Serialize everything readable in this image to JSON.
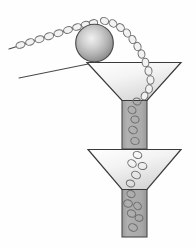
{
  "figure": {
    "title": "Ball and pebbles feeding a two-stage funnel",
    "background_color": "#fefefe",
    "width": 195,
    "height": 247
  },
  "palette": {
    "outline": "#3a3a3a",
    "outline_light": "#5a5a5a",
    "sphere_highlight": "#efefef",
    "sphere_mid": "#b8b8b8",
    "sphere_edge": "#8d8d8d",
    "funnel_light": "#ffffff",
    "funnel_shade": "#dcdcdc",
    "stem_fill": "#a9a9a9",
    "stem_fill_dark": "#9c9c9c",
    "pebble_fill": "#f2f2f2",
    "pebble_outline": "#707070",
    "pebble_in_stem_outline": "#6e6e6e",
    "ramp_line": "#4a4a4a"
  },
  "parts": {
    "ramp_upper_label": "inclined-ramp-upper",
    "ramp_lower_label": "inclined-ramp-lower",
    "sphere_label": "large-sphere",
    "funnel_top_label": "upper-funnel",
    "funnel_bottom_label": "lower-funnel",
    "stem_top_label": "upper-funnel-stem",
    "stem_bottom_label": "lower-funnel-stem",
    "stream_label": "pebble-stream"
  },
  "geometry": {
    "ramp_upper": {
      "x1": 9,
      "y1": 49,
      "x2": 97,
      "y2": 21
    },
    "ramp_lower": {
      "x1": 19,
      "y1": 78,
      "x2": 96,
      "y2": 62
    },
    "sphere": {
      "cx": 94.5,
      "cy": 43.0,
      "r": 18.8
    },
    "funnel_top": {
      "left_x": 87,
      "right_x": 181,
      "rim_y": 62.5,
      "throat_left": 122,
      "throat_right": 147,
      "throat_y": 100
    },
    "funnel_bottom": {
      "left_x": 88,
      "right_x": 181,
      "rim_y": 149.5,
      "throat_left": 122,
      "throat_right": 147,
      "throat_y": 189
    },
    "stem_top": {
      "x": 122,
      "y": 100,
      "w": 25,
      "h": 49
    },
    "stem_bottom": {
      "x": 122,
      "y": 189,
      "w": 25,
      "h": 48
    }
  },
  "pebbles_on_ramp": [
    {
      "cx": 20.5,
      "cy": 45.0,
      "rx": 4.6,
      "ry": 3.2,
      "rot": -18
    },
    {
      "cx": 30.0,
      "cy": 42.0,
      "rx": 4.4,
      "ry": 3.2,
      "rot": -18
    },
    {
      "cx": 39.5,
      "cy": 39.2,
      "rx": 4.6,
      "ry": 3.3,
      "rot": -16
    },
    {
      "cx": 49.0,
      "cy": 36.2,
      "rx": 4.7,
      "ry": 3.4,
      "rot": -18
    },
    {
      "cx": 58.5,
      "cy": 33.2,
      "rx": 4.6,
      "ry": 3.3,
      "rot": -16
    },
    {
      "cx": 68.0,
      "cy": 30.0,
      "rx": 4.5,
      "ry": 3.3,
      "rot": -18
    },
    {
      "cx": 77.0,
      "cy": 27.0,
      "rx": 4.4,
      "ry": 3.2,
      "rot": -16
    },
    {
      "cx": 85.5,
      "cy": 24.4,
      "rx": 4.3,
      "ry": 3.1,
      "rot": -14
    },
    {
      "cx": 93.5,
      "cy": 22.8,
      "rx": 4.2,
      "ry": 3.2,
      "rot": -8
    }
  ],
  "pebbles_in_stream": [
    {
      "cx": 104.5,
      "cy": 21.0,
      "rx": 4.2,
      "ry": 3.4,
      "rot": 24
    },
    {
      "cx": 113.0,
      "cy": 23.5,
      "rx": 4.1,
      "ry": 3.4,
      "rot": 38
    },
    {
      "cx": 120.5,
      "cy": 27.5,
      "rx": 4.2,
      "ry": 3.5,
      "rot": 48
    },
    {
      "cx": 127.0,
      "cy": 33.0,
      "rx": 4.3,
      "ry": 3.4,
      "rot": 58
    },
    {
      "cx": 132.5,
      "cy": 39.5,
      "rx": 4.2,
      "ry": 3.4,
      "rot": 66
    },
    {
      "cx": 137.5,
      "cy": 46.5,
      "rx": 4.3,
      "ry": 3.5,
      "rot": 72
    },
    {
      "cx": 141.5,
      "cy": 54.0,
      "rx": 4.2,
      "ry": 3.4,
      "rot": 78
    },
    {
      "cx": 145.5,
      "cy": 62.5,
      "rx": 4.3,
      "ry": 3.4,
      "rot": 82
    },
    {
      "cx": 148.5,
      "cy": 71.0,
      "rx": 4.3,
      "ry": 3.5,
      "rot": 84
    },
    {
      "cx": 150.5,
      "cy": 80.0,
      "rx": 4.2,
      "ry": 3.5,
      "rot": 86
    },
    {
      "cx": 149.0,
      "cy": 89.0,
      "rx": 4.2,
      "ry": 3.4,
      "rot": 96
    },
    {
      "cx": 144.5,
      "cy": 96.0,
      "rx": 4.0,
      "ry": 3.3,
      "rot": 108
    }
  ],
  "pebbles_in_stem_top": [
    {
      "cx": 137.0,
      "cy": 101.5,
      "rx": 4.0,
      "ry": 3.4,
      "rot": 20
    },
    {
      "cx": 132.0,
      "cy": 110.0,
      "rx": 4.2,
      "ry": 3.5,
      "rot": 35
    },
    {
      "cx": 135.0,
      "cy": 119.5,
      "rx": 4.1,
      "ry": 3.5,
      "rot": 10
    },
    {
      "cx": 133.0,
      "cy": 130.0,
      "rx": 4.4,
      "ry": 3.6,
      "rot": 25
    },
    {
      "cx": 135.0,
      "cy": 141.0,
      "rx": 4.2,
      "ry": 3.5,
      "rot": 15
    }
  ],
  "pebbles_in_funnel_bottom": [
    {
      "cx": 137.5,
      "cy": 155.0,
      "rx": 4.4,
      "ry": 3.4,
      "rot": 20
    },
    {
      "cx": 132.0,
      "cy": 163.5,
      "rx": 4.5,
      "ry": 3.5,
      "rot": 35
    },
    {
      "cx": 142.5,
      "cy": 166.0,
      "rx": 4.4,
      "ry": 3.5,
      "rot": 12
    },
    {
      "cx": 136.0,
      "cy": 175.0,
      "rx": 4.6,
      "ry": 3.6,
      "rot": 28
    },
    {
      "cx": 130.5,
      "cy": 183.5,
      "rx": 4.3,
      "ry": 3.4,
      "rot": 18
    }
  ],
  "pebbles_in_stem_bottom": [
    {
      "cx": 131.0,
      "cy": 194.0,
      "rx": 4.2,
      "ry": 3.5,
      "rot": 30
    },
    {
      "cx": 128.0,
      "cy": 203.5,
      "rx": 4.4,
      "ry": 3.6,
      "rot": 15
    },
    {
      "cx": 137.5,
      "cy": 206.0,
      "rx": 4.1,
      "ry": 3.4,
      "rot": 40
    },
    {
      "cx": 131.5,
      "cy": 213.5,
      "rx": 4.3,
      "ry": 3.5,
      "rot": 22
    },
    {
      "cx": 139.0,
      "cy": 218.0,
      "rx": 4.0,
      "ry": 3.3,
      "rot": 8
    },
    {
      "cx": 133.0,
      "cy": 227.5,
      "rx": 4.5,
      "ry": 3.6,
      "rot": 25
    }
  ]
}
